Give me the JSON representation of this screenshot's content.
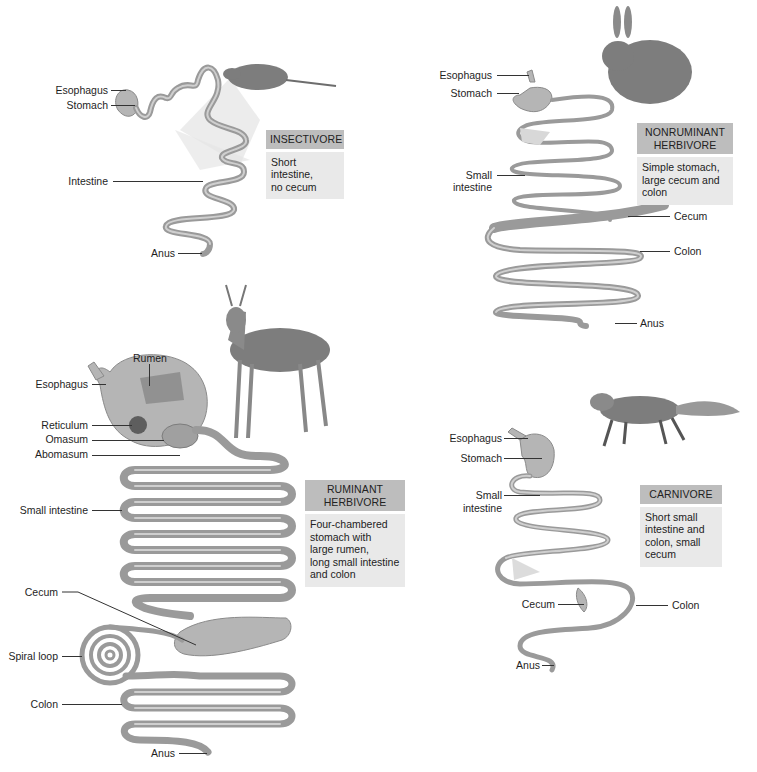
{
  "figure": {
    "panels": [
      {
        "id": "insectivore",
        "title": "INSECTIVORE",
        "description": "Short intestine, no cecum",
        "description_lines": [
          "Short intestine,",
          "no cecum"
        ],
        "animal": "shrew",
        "labels": [
          "Esophagus",
          "Stomach",
          "Intestine",
          "Anus"
        ]
      },
      {
        "id": "nonruminant-herbivore",
        "title_lines": [
          "NONRUMINANT",
          "HERBIVORE"
        ],
        "description_lines": [
          "Simple stomach,",
          "large cecum and",
          "colon"
        ],
        "animal": "rabbit",
        "labels": [
          "Esophagus",
          "Stomach",
          "Small",
          "intestine",
          "Cecum",
          "Colon",
          "Anus"
        ]
      },
      {
        "id": "ruminant-herbivore",
        "title_lines": [
          "RUMINANT",
          "HERBIVORE"
        ],
        "description_lines": [
          "Four-chambered",
          "stomach with",
          "large rumen,",
          "long small intestine",
          "and colon"
        ],
        "animal": "deer",
        "labels": [
          "Rumen",
          "Esophagus",
          "Reticulum",
          "Omasum",
          "Abomasum",
          "Small intestine",
          "Cecum",
          "Spiral loop",
          "Colon",
          "Anus"
        ]
      },
      {
        "id": "carnivore",
        "title": "CARNIVORE",
        "description_lines": [
          "Short small",
          "intestine and",
          "colon, small",
          "cecum"
        ],
        "animal": "fox",
        "labels": [
          "Esophagus",
          "Stomach",
          "Small",
          "intestine",
          "Cecum",
          "Colon",
          "Anus"
        ]
      }
    ]
  },
  "colors": {
    "title_box": "#bdbdbd",
    "desc_box": "#e9e9e9",
    "gut": "#9a9a9a",
    "background": "#ffffff"
  }
}
